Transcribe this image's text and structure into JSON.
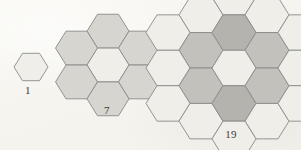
{
  "figure": {
    "kind": "centered-hexagonal-number-diagram",
    "background_color": "#f7f6f2",
    "stroke_color": "#8a8a8a",
    "stroke_width": 0.9,
    "palette": {
      "light": "#efeee9",
      "mid": "#d6d5d0",
      "dark": "#c2c1bc",
      "darker": "#b4b3ae"
    },
    "hex_orientation": "flat-top",
    "panels": [
      {
        "id": "panel-1",
        "label": "1",
        "count": 1,
        "rings": 0,
        "hex_radius": 17,
        "cells": [
          {
            "col": 0,
            "row": 0,
            "shade": "light"
          }
        ]
      },
      {
        "id": "panel-7",
        "label": "7",
        "count": 7,
        "rings": 1,
        "hex_radius": 21,
        "cells": [
          {
            "col": 0,
            "row": -1,
            "shade": "mid"
          },
          {
            "col": -1,
            "row": -0.5,
            "shade": "mid"
          },
          {
            "col": 1,
            "row": -0.5,
            "shade": "mid"
          },
          {
            "col": 0,
            "row": 0,
            "shade": "light"
          },
          {
            "col": -1,
            "row": 0.5,
            "shade": "mid"
          },
          {
            "col": 1,
            "row": 0.5,
            "shade": "mid"
          },
          {
            "col": 0,
            "row": 1,
            "shade": "mid"
          }
        ]
      },
      {
        "id": "panel-19",
        "label": "19",
        "count": 19,
        "rings": 2,
        "hex_radius": 22,
        "cells": [
          {
            "col": -1,
            "row": -1.5,
            "shade": "light"
          },
          {
            "col": 0,
            "row": -2,
            "shade": "light"
          },
          {
            "col": 1,
            "row": -1.5,
            "shade": "light"
          },
          {
            "col": -2,
            "row": -1,
            "shade": "light"
          },
          {
            "col": -1,
            "row": -0.5,
            "shade": "dark"
          },
          {
            "col": 0,
            "row": -1,
            "shade": "darker"
          },
          {
            "col": 1,
            "row": -0.5,
            "shade": "dark"
          },
          {
            "col": 2,
            "row": -1,
            "shade": "light"
          },
          {
            "col": -2,
            "row": 0,
            "shade": "light"
          },
          {
            "col": -1,
            "row": 0.5,
            "shade": "dark"
          },
          {
            "col": 0,
            "row": 0,
            "shade": "light"
          },
          {
            "col": 1,
            "row": 0.5,
            "shade": "dark"
          },
          {
            "col": 2,
            "row": 0,
            "shade": "light"
          },
          {
            "col": -2,
            "row": 1,
            "shade": "light"
          },
          {
            "col": -1,
            "row": 1.5,
            "shade": "light"
          },
          {
            "col": 0,
            "row": 1,
            "shade": "darker"
          },
          {
            "col": 1,
            "row": 1.5,
            "shade": "light"
          },
          {
            "col": 2,
            "row": 1,
            "shade": "light"
          },
          {
            "col": 0,
            "row": 2,
            "shade": "light"
          }
        ]
      }
    ]
  },
  "labels": {
    "one": "1",
    "seven": "7",
    "nineteen": "19"
  }
}
